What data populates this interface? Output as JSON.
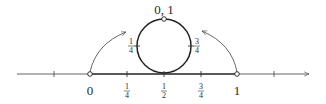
{
  "diagram": {
    "number_line": {
      "extra_ticks_outside": 2,
      "arrow": "right",
      "points": [
        {
          "value": 0,
          "label": "0",
          "marker": "open-circle"
        },
        {
          "value": 0.25,
          "label_num": "1",
          "label_den": "4",
          "marker": "tick"
        },
        {
          "value": 0.5,
          "label_num": "1",
          "label_den": "2",
          "marker": "tick"
        },
        {
          "value": 0.75,
          "label_num": "3",
          "label_den": "4",
          "marker": "tick"
        },
        {
          "value": 1,
          "label": "1",
          "marker": "open-circle"
        }
      ]
    },
    "circle": {
      "top_label": "0, 1",
      "left_label_num": "1",
      "left_label_den": "4",
      "right_label_num": "3",
      "right_label_den": "4"
    },
    "arrows": [
      {
        "from": "0",
        "to": "circle-left",
        "meaning": "endpoint 0 maps to top of circle"
      },
      {
        "from": "1",
        "to": "circle-right",
        "meaning": "endpoint 1 maps to top of circle"
      }
    ],
    "colors": {
      "line": "#2a2a2a",
      "arrow": "#555555"
    }
  }
}
